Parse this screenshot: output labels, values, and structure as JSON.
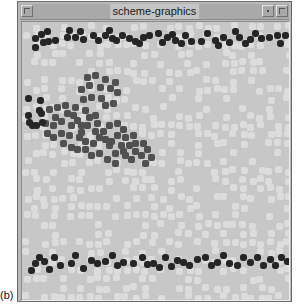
{
  "window": {
    "title": "scheme-graphics",
    "buttons": [
      "window-menu",
      "minimize",
      "maximize"
    ]
  },
  "caption": "(b)",
  "colors": {
    "background": "#c7c7c7",
    "light_particle": "#dcdcdc",
    "dark_particle": "#252525",
    "cluster_particle": "#505050",
    "frame": "#b9b9b9"
  },
  "particles": {
    "top_band_dark": [
      [
        10,
        13
      ],
      [
        10,
        22
      ],
      [
        16,
        9
      ],
      [
        18,
        17
      ],
      [
        22,
        6
      ],
      [
        23,
        16
      ],
      [
        30,
        15
      ],
      [
        42,
        12
      ],
      [
        44,
        5
      ],
      [
        50,
        12
      ],
      [
        55,
        6
      ],
      [
        58,
        14
      ],
      [
        68,
        10
      ],
      [
        73,
        15
      ],
      [
        80,
        10
      ],
      [
        84,
        5
      ],
      [
        87,
        13
      ],
      [
        91,
        15
      ],
      [
        97,
        10
      ],
      [
        104,
        13
      ],
      [
        110,
        16
      ],
      [
        114,
        18
      ],
      [
        118,
        12
      ],
      [
        124,
        10
      ],
      [
        133,
        8
      ],
      [
        137,
        17
      ],
      [
        142,
        12
      ],
      [
        147,
        9
      ],
      [
        150,
        15
      ],
      [
        156,
        18
      ],
      [
        160,
        10
      ],
      [
        166,
        16
      ],
      [
        176,
        16
      ],
      [
        182,
        8
      ],
      [
        190,
        15
      ],
      [
        193,
        20
      ],
      [
        198,
        12
      ],
      [
        204,
        17
      ],
      [
        210,
        6
      ],
      [
        214,
        12
      ],
      [
        220,
        18
      ],
      [
        225,
        14
      ],
      [
        230,
        8
      ],
      [
        236,
        13
      ],
      [
        244,
        12
      ],
      [
        252,
        10
      ],
      [
        255,
        18
      ],
      [
        260,
        10
      ]
    ],
    "bottom_band_dark": [
      [
        6,
        245
      ],
      [
        10,
        238
      ],
      [
        14,
        232
      ],
      [
        19,
        236
      ],
      [
        24,
        244
      ],
      [
        29,
        232
      ],
      [
        35,
        240
      ],
      [
        46,
        238
      ],
      [
        50,
        230
      ],
      [
        58,
        243
      ],
      [
        66,
        235
      ],
      [
        72,
        238
      ],
      [
        80,
        236
      ],
      [
        87,
        230
      ],
      [
        92,
        240
      ],
      [
        98,
        237
      ],
      [
        108,
        238
      ],
      [
        117,
        232
      ],
      [
        122,
        239
      ],
      [
        128,
        238
      ],
      [
        134,
        242
      ],
      [
        140,
        232
      ],
      [
        146,
        241
      ],
      [
        152,
        235
      ],
      [
        158,
        237
      ],
      [
        164,
        240
      ],
      [
        172,
        234
      ],
      [
        180,
        232
      ],
      [
        186,
        240
      ],
      [
        192,
        237
      ],
      [
        198,
        230
      ],
      [
        204,
        238
      ],
      [
        212,
        240
      ],
      [
        218,
        232
      ],
      [
        225,
        237
      ],
      [
        232,
        232
      ],
      [
        238,
        240
      ],
      [
        245,
        234
      ],
      [
        250,
        240
      ],
      [
        256,
        232
      ],
      [
        262,
        236
      ]
    ],
    "cluster_edge_dark": [
      [
        3,
        73
      ],
      [
        3,
        90
      ],
      [
        4,
        97
      ],
      [
        7,
        100
      ],
      [
        11,
        100
      ],
      [
        14,
        85
      ],
      [
        15,
        75
      ],
      [
        16,
        88
      ],
      [
        17,
        97
      ]
    ],
    "cluster_mid": [
      [
        62,
        52
      ],
      [
        70,
        50
      ],
      [
        80,
        54
      ],
      [
        64,
        60
      ],
      [
        75,
        62
      ],
      [
        85,
        63
      ],
      [
        90,
        57
      ],
      [
        92,
        67
      ],
      [
        56,
        64
      ],
      [
        58,
        74
      ],
      [
        66,
        72
      ],
      [
        76,
        73
      ],
      [
        80,
        80
      ],
      [
        88,
        78
      ],
      [
        60,
        85
      ],
      [
        64,
        92
      ],
      [
        70,
        90
      ],
      [
        52,
        95
      ],
      [
        62,
        100
      ],
      [
        72,
        98
      ],
      [
        46,
        100
      ],
      [
        56,
        107
      ],
      [
        70,
        106
      ],
      [
        78,
        106
      ],
      [
        84,
        100
      ],
      [
        92,
        98
      ],
      [
        98,
        104
      ],
      [
        92,
        110
      ],
      [
        100,
        112
      ],
      [
        108,
        110
      ],
      [
        110,
        118
      ],
      [
        104,
        120
      ],
      [
        96,
        120
      ],
      [
        118,
        118
      ],
      [
        122,
        124
      ],
      [
        110,
        126
      ],
      [
        116,
        130
      ],
      [
        120,
        138
      ],
      [
        126,
        132
      ],
      [
        106,
        134
      ],
      [
        100,
        130
      ],
      [
        90,
        128
      ],
      [
        84,
        120
      ],
      [
        80,
        114
      ],
      [
        74,
        112
      ],
      [
        68,
        118
      ],
      [
        60,
        116
      ],
      [
        54,
        112
      ],
      [
        44,
        110
      ],
      [
        36,
        108
      ],
      [
        28,
        112
      ],
      [
        22,
        108
      ],
      [
        20,
        98
      ],
      [
        28,
        100
      ],
      [
        36,
        96
      ],
      [
        42,
        88
      ],
      [
        30,
        92
      ],
      [
        24,
        84
      ],
      [
        32,
        82
      ],
      [
        40,
        80
      ],
      [
        48,
        90
      ],
      [
        50,
        82
      ],
      [
        56,
        100
      ],
      [
        38,
        118
      ],
      [
        46,
        122
      ],
      [
        52,
        124
      ],
      [
        60,
        124
      ],
      [
        66,
        130
      ],
      [
        74,
        128
      ],
      [
        82,
        134
      ],
      [
        90,
        138
      ],
      [
        98,
        126
      ],
      [
        86,
        116
      ]
    ]
  }
}
